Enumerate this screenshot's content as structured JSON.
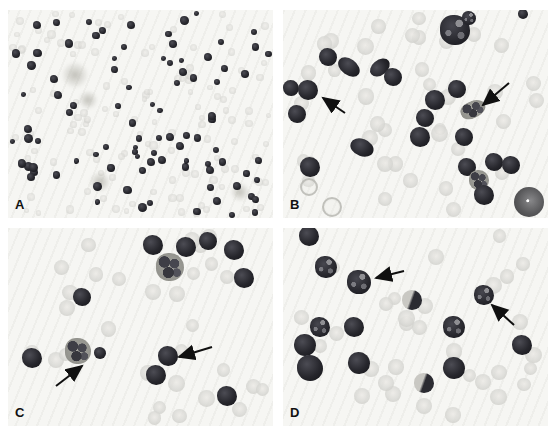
{
  "figure": {
    "figure_type": "four-panel cytology photomicrograph",
    "colors": {
      "panel_bg": "#f6f6f3",
      "dark_cell": "#27272d",
      "pale_cell": "#d8d8d4",
      "arrow": "#101010",
      "label": "#111111"
    },
    "panels": [
      {
        "id": "A",
        "label": "A",
        "cells": [
          {
            "x": 67,
            "y": 65,
            "r": 14,
            "t": "smudge"
          },
          {
            "x": 80,
            "y": 90,
            "r": 10,
            "t": "smudge"
          },
          {
            "x": 92,
            "y": 172,
            "r": 11,
            "t": "smudge"
          },
          {
            "x": 232,
            "y": 182,
            "r": 10,
            "t": "smudge"
          }
        ],
        "random_cells": {
          "seed": 7,
          "pale_count": 120,
          "pale_r": [
            2.6,
            4.2
          ],
          "dark_count": 92,
          "dark_r": [
            2.5,
            4.5
          ]
        },
        "arrows": []
      },
      {
        "id": "B",
        "label": "B",
        "cells": [
          {
            "x": 240,
            "y": 4,
            "r": 5,
            "t": "dark"
          },
          {
            "x": 172,
            "y": 20,
            "r": 15,
            "t": "mottled-dark"
          },
          {
            "x": 186,
            "y": 8,
            "r": 7,
            "t": "mottled-dark"
          },
          {
            "x": 45,
            "y": 47,
            "r": 9,
            "t": "dark"
          },
          {
            "x": 66,
            "y": 57,
            "r": 10,
            "t": "dark",
            "w": 24,
            "h": 16,
            "rot": 35
          },
          {
            "x": 97,
            "y": 57,
            "r": 9,
            "t": "dark",
            "w": 22,
            "h": 15,
            "rot": -40
          },
          {
            "x": 110,
            "y": 67,
            "r": 9,
            "t": "dark"
          },
          {
            "x": 8,
            "y": 78,
            "r": 8,
            "t": "dark"
          },
          {
            "x": 25,
            "y": 80,
            "r": 10,
            "t": "dark"
          },
          {
            "x": 14,
            "y": 104,
            "r": 9,
            "t": "dark"
          },
          {
            "x": 152,
            "y": 90,
            "r": 10,
            "t": "dark"
          },
          {
            "x": 174,
            "y": 79,
            "r": 9,
            "t": "dark"
          },
          {
            "x": 190,
            "y": 99,
            "r": 10,
            "t": "mottled",
            "w": 26,
            "h": 17,
            "rot": -25
          },
          {
            "x": 142,
            "y": 108,
            "r": 9,
            "t": "dark"
          },
          {
            "x": 137,
            "y": 127,
            "r": 10,
            "t": "dark"
          },
          {
            "x": 181,
            "y": 127,
            "r": 9,
            "t": "dark"
          },
          {
            "x": 79,
            "y": 137,
            "r": 10,
            "t": "dark",
            "w": 24,
            "h": 17,
            "rot": 20
          },
          {
            "x": 27,
            "y": 157,
            "r": 10,
            "t": "dark"
          },
          {
            "x": 184,
            "y": 157,
            "r": 9,
            "t": "dark"
          },
          {
            "x": 196,
            "y": 170,
            "r": 10,
            "t": "mottled"
          },
          {
            "x": 211,
            "y": 152,
            "r": 9,
            "t": "dark"
          },
          {
            "x": 228,
            "y": 155,
            "r": 9,
            "t": "dark"
          },
          {
            "x": 201,
            "y": 185,
            "r": 10,
            "t": "dark"
          },
          {
            "x": 246,
            "y": 192,
            "r": 15,
            "t": "big-gray"
          },
          {
            "x": 26,
            "y": 177,
            "r": 9,
            "t": "ring"
          },
          {
            "x": 49,
            "y": 197,
            "r": 10,
            "t": "ring"
          }
        ],
        "random_cells": {
          "seed": 11,
          "pale_count": 40,
          "pale_r": [
            6,
            8.5
          ]
        },
        "arrows": [
          {
            "x1": 62,
            "y1": 103,
            "x2": 40,
            "y2": 88
          },
          {
            "x1": 226,
            "y1": 73,
            "x2": 200,
            "y2": 95
          }
        ]
      },
      {
        "id": "C",
        "label": "C",
        "cells": [
          {
            "x": 145,
            "y": 17,
            "r": 10,
            "t": "dark"
          },
          {
            "x": 178,
            "y": 19,
            "r": 10,
            "t": "dark"
          },
          {
            "x": 200,
            "y": 13,
            "r": 9,
            "t": "dark"
          },
          {
            "x": 226,
            "y": 22,
            "r": 10,
            "t": "dark"
          },
          {
            "x": 162,
            "y": 39,
            "r": 14,
            "t": "mottled"
          },
          {
            "x": 236,
            "y": 50,
            "r": 10,
            "t": "dark"
          },
          {
            "x": 74,
            "y": 69,
            "r": 9,
            "t": "dark"
          },
          {
            "x": 24,
            "y": 130,
            "r": 10,
            "t": "dark"
          },
          {
            "x": 70,
            "y": 123,
            "r": 13,
            "t": "mottled"
          },
          {
            "x": 92,
            "y": 125,
            "r": 6,
            "t": "dark"
          },
          {
            "x": 160,
            "y": 128,
            "r": 10,
            "t": "dark"
          },
          {
            "x": 148,
            "y": 147,
            "r": 10,
            "t": "dark"
          },
          {
            "x": 219,
            "y": 168,
            "r": 10,
            "t": "dark"
          }
        ],
        "random_cells": {
          "seed": 23,
          "pale_count": 30,
          "pale_r": [
            6.5,
            8.5
          ]
        },
        "arrows": [
          {
            "x1": 48,
            "y1": 158,
            "x2": 74,
            "y2": 138
          },
          {
            "x1": 204,
            "y1": 119,
            "x2": 171,
            "y2": 129
          }
        ]
      },
      {
        "id": "D",
        "label": "D",
        "cells": [
          {
            "x": 26,
            "y": 8,
            "r": 10,
            "t": "dark"
          },
          {
            "x": 43,
            "y": 39,
            "r": 11,
            "t": "mottled-dark"
          },
          {
            "x": 76,
            "y": 54,
            "r": 12,
            "t": "mottled-dark"
          },
          {
            "x": 129,
            "y": 72,
            "r": 10,
            "t": "half"
          },
          {
            "x": 201,
            "y": 67,
            "r": 10,
            "t": "mottled-dark"
          },
          {
            "x": 37,
            "y": 99,
            "r": 10,
            "t": "mottled-dark"
          },
          {
            "x": 71,
            "y": 99,
            "r": 10,
            "t": "dark"
          },
          {
            "x": 22,
            "y": 117,
            "r": 11,
            "t": "dark"
          },
          {
            "x": 27,
            "y": 140,
            "r": 13,
            "t": "dark"
          },
          {
            "x": 76,
            "y": 135,
            "r": 11,
            "t": "dark"
          },
          {
            "x": 171,
            "y": 99,
            "r": 11,
            "t": "mottled-dark"
          },
          {
            "x": 239,
            "y": 117,
            "r": 10,
            "t": "dark"
          },
          {
            "x": 171,
            "y": 140,
            "r": 11,
            "t": "dark"
          },
          {
            "x": 141,
            "y": 155,
            "r": 10,
            "t": "half"
          }
        ],
        "random_cells": {
          "seed": 31,
          "pale_count": 32,
          "pale_r": [
            6.5,
            8.5
          ]
        },
        "arrows": [
          {
            "x1": 121,
            "y1": 43,
            "x2": 93,
            "y2": 50
          },
          {
            "x1": 231,
            "y1": 97,
            "x2": 209,
            "y2": 77
          }
        ]
      }
    ]
  }
}
